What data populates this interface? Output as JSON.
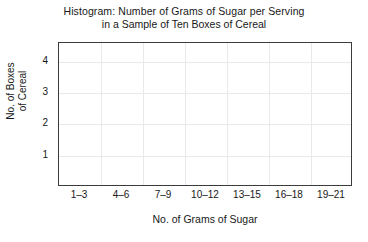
{
  "chart_data": {
    "type": "bar",
    "title": "Histogram:  Number of Grams of Sugar per Serving in a Sample of Ten Boxes of Cereal",
    "title_lines": [
      "Histogram:  Number of Grams of Sugar per Serving",
      "in a Sample of Ten Boxes of Cereal"
    ],
    "xlabel": "No. of Grams of Sugar",
    "ylabel": "No. of Boxes of Cereal",
    "ylabel_lines": [
      "No. of Boxes",
      "of Cereal"
    ],
    "categories": [
      "1–3",
      "4–6",
      "7–9",
      "10–12",
      "13–15",
      "16–18",
      "19–21"
    ],
    "values": [
      null,
      null,
      null,
      null,
      null,
      null,
      null
    ],
    "yticks": [
      1,
      2,
      3,
      4
    ],
    "ylim": [
      0,
      4.6
    ],
    "grid": true,
    "legend": "none",
    "note": "Blank histogram template — axes and grid drawn, no bars plotted"
  },
  "colors": {
    "frame": "#3b3b3b",
    "grid": "#e9e9e9",
    "text": "#181818",
    "bar": "#c9c9c9",
    "background": "#ffffff"
  }
}
